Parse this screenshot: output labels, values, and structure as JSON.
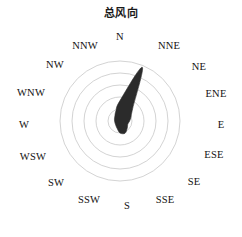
{
  "chart": {
    "title": "总风向"
  },
  "chart_data": {
    "type": "line",
    "plot_kind": "wind-rose-polar",
    "title": "总风向",
    "xlabel": "",
    "ylabel": "",
    "grid": true,
    "legend": null,
    "legend_position": "none",
    "grid_rings": 5,
    "ring_radii_px": [
      12,
      24,
      36,
      48,
      60
    ],
    "axis_range": [
      0,
      1
    ],
    "center_px": [
      120,
      121
    ],
    "outer_radius_px": 60,
    "fill_color": "#2b2b2b",
    "grid_color": "#c8c8c8",
    "label_color": "#111111",
    "categories": [
      "N",
      "NNE",
      "NE",
      "ENE",
      "E",
      "ESE",
      "SE",
      "SSE",
      "S",
      "SSW",
      "SW",
      "WSW",
      "W",
      "WNW",
      "NW",
      "NNW"
    ],
    "angles_deg": [
      0,
      22.5,
      45,
      67.5,
      90,
      112.5,
      135,
      157.5,
      180,
      202.5,
      225,
      247.5,
      270,
      292.5,
      315,
      337.5
    ],
    "values": [
      0.34,
      0.97,
      0.3,
      0.2,
      0.16,
      0.14,
      0.17,
      0.22,
      0.2,
      0.13,
      0.1,
      0.09,
      0.09,
      0.1,
      0.12,
      0.18
    ],
    "label_radius_px": 76
  },
  "labels": [
    {
      "text": "N",
      "x": 120,
      "y": 36
    },
    {
      "text": "NNE",
      "x": 169,
      "y": 45
    },
    {
      "text": "NE",
      "x": 199,
      "y": 66
    },
    {
      "text": "ENE",
      "x": 216,
      "y": 93
    },
    {
      "text": "E",
      "x": 221,
      "y": 124
    },
    {
      "text": "ESE",
      "x": 214,
      "y": 154
    },
    {
      "text": "SE",
      "x": 194,
      "y": 181
    },
    {
      "text": "SSE",
      "x": 165,
      "y": 199
    },
    {
      "text": "S",
      "x": 127,
      "y": 205
    },
    {
      "text": "SSW",
      "x": 89,
      "y": 199
    },
    {
      "text": "SW",
      "x": 56,
      "y": 182
    },
    {
      "text": "WSW",
      "x": 33,
      "y": 156
    },
    {
      "text": "W",
      "x": 24,
      "y": 124
    },
    {
      "text": "WNW",
      "x": 31,
      "y": 92
    },
    {
      "text": "NW",
      "x": 55,
      "y": 64
    },
    {
      "text": "NNW",
      "x": 85,
      "y": 45
    }
  ]
}
